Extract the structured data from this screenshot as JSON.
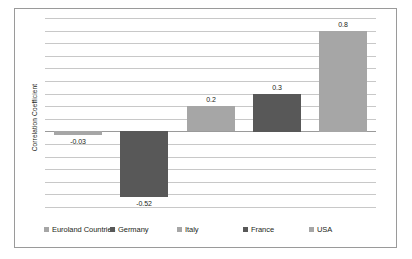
{
  "chart_data": {
    "type": "bar",
    "title": "",
    "subtitle": "",
    "xlabel": "",
    "ylabel": "Correlation Coefficient",
    "categories": [
      "Euroland Countries",
      "Germany",
      "Italy",
      "France",
      "USA"
    ],
    "values": [
      -0.03,
      -0.52,
      0.2,
      0.3,
      0.8
    ],
    "value_labels": [
      "-0.03",
      "-0.52",
      "0.2",
      "0.3",
      "0.8"
    ],
    "series": [
      {
        "name": "Correlation Coefficient",
        "values": [
          -0.03,
          -0.52,
          0.2,
          0.3,
          0.8
        ]
      }
    ],
    "ylim": [
      -0.6,
      0.9
    ],
    "y_tick_step": 0.1,
    "y_ticks": [
      0.9,
      0.8,
      0.7,
      0.6,
      0.5,
      0.4,
      0.3,
      0.2,
      0.1,
      0.0,
      -0.1,
      -0.2,
      -0.3,
      -0.4,
      -0.5,
      -0.6
    ],
    "y_tick_labels_visible": false,
    "x_tick_labels_visible": false,
    "grid": true,
    "grid_axis": "y",
    "zero_line": 0,
    "legend_position": "bottom",
    "bar_colors": [
      "#a6a6a6",
      "#585858",
      "#a6a6a6",
      "#585858",
      "#a6a6a6"
    ],
    "plot_background": "#ffffff",
    "grid_color": "#c8c8c8",
    "frame_color": "#9a9a9a",
    "text_color": "#231f20"
  },
  "legend": {
    "items": [
      {
        "label": "Euroland Countries",
        "color": "#a6a6a6"
      },
      {
        "label": "Germany",
        "color": "#585858"
      },
      {
        "label": "Italy",
        "color": "#a6a6a6"
      },
      {
        "label": "France",
        "color": "#585858"
      },
      {
        "label": "USA",
        "color": "#a6a6a6"
      }
    ]
  },
  "axis": {
    "y_title": "Correlation Coefficient"
  }
}
